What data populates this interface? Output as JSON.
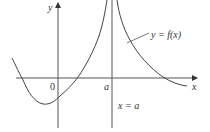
{
  "diagram": {
    "type": "function-graph",
    "axes": {
      "x_label": "x",
      "y_label": "y",
      "origin_label": "0"
    },
    "asymptote": {
      "tick_label": "a",
      "equation_label": "x = a"
    },
    "curve": {
      "label": "y = f(x)"
    },
    "colors": {
      "axis": "#555555",
      "curve": "#444444",
      "text": "#333333"
    }
  }
}
